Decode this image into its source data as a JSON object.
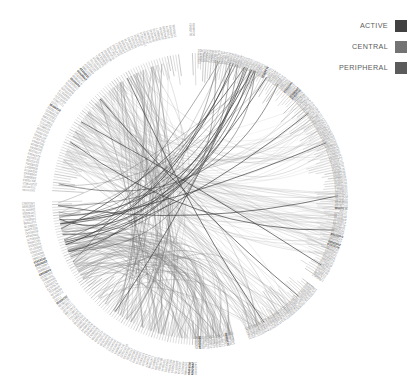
{
  "legend": {
    "items": [
      {
        "label": "ACTIVE",
        "color": "#414141"
      },
      {
        "label": "CENTRAL",
        "color": "#737373"
      },
      {
        "label": "PERIPHERAL",
        "color": "#5b5b5b"
      }
    ]
  },
  "chart_data": {
    "type": "chord",
    "title": "",
    "subtitle": "",
    "xlabel": "",
    "ylabel": "",
    "grid": false,
    "legend_position": "top-right",
    "center": {
      "x": 198,
      "y": 199
    },
    "radius": {
      "label_outer": 176,
      "label_inner": 150,
      "ring": 146,
      "chord": 140
    },
    "palette": {
      "background": "#ffffff",
      "label_default": "#8d8d8d",
      "label_highlight": "#3f3f3f",
      "chord_light": "#b4b4b4",
      "chord_mid": "#8a8a8a",
      "chord_dark": "#3a3a3a"
    },
    "groups": [
      {
        "name": "CENTRAL",
        "start_deg": 273,
        "end_deg": 353,
        "color": "#737373",
        "nodes": 76
      },
      {
        "name": "PERIPHERAL",
        "start_deg": 357,
        "end_deg": 123,
        "color": "#5b5b5b",
        "nodes": 122
      },
      {
        "name": "ACTIVE",
        "start_deg": 127,
        "end_deg": 160,
        "color": "#414141",
        "nodes": 32
      },
      {
        "name": "CENTRAL",
        "start_deg": 165,
        "end_deg": 269,
        "color": "#737373",
        "nodes": 98
      }
    ],
    "gaps_deg": [
      [
        353,
        357
      ],
      [
        123,
        127
      ],
      [
        160,
        165
      ],
      [
        269,
        273
      ]
    ],
    "node_count": 328,
    "node_labels": [
      "102570813",
      "30175963",
      "30096901",
      "30490243",
      "30240073",
      "30098077",
      "32480064",
      "54415039",
      "37105074",
      "41976083",
      "11781008",
      "30158061",
      "30148093",
      "30138064",
      "30148044",
      "40790090",
      "20128051",
      "10161018",
      "10298017",
      "10567011",
      "70481010",
      "20421088",
      "10064037",
      "10680020",
      "30178039",
      "31349936",
      "71022",
      "71709400",
      "49097100",
      "40985011",
      "41910173",
      "41005029",
      "50440017",
      "75079805",
      "33910210",
      "04000069",
      "47098850",
      "14601910",
      "29950929",
      "30191919",
      "10270986",
      "49091027",
      "11019203",
      "30920715",
      "41093016",
      "50210984",
      "60930175",
      "70915044",
      "80190332",
      "90210455",
      "10380276",
      "11470398",
      "12560417",
      "13650536",
      "14740655",
      "15830774",
      "16920893",
      "18010912",
      "19100031",
      "20190150"
    ],
    "highlight_labels": [
      "31349936",
      "04000069",
      "29950929",
      "30191919"
    ],
    "chord_bundles": [
      {
        "from_deg": 168,
        "to_deg": 236,
        "weight": 58,
        "shade": "#8f8f8f",
        "opacity": 0.55
      },
      {
        "from_deg": 180,
        "to_deg": 248,
        "weight": 52,
        "shade": "#858585",
        "opacity": 0.5
      },
      {
        "from_deg": 205,
        "to_deg": 330,
        "weight": 64,
        "shade": "#7d7d7d",
        "opacity": 0.5
      },
      {
        "from_deg": 150,
        "to_deg": 300,
        "weight": 46,
        "shade": "#9a9a9a",
        "opacity": 0.45
      },
      {
        "from_deg": 100,
        "to_deg": 300,
        "weight": 70,
        "shade": "#b0b0b0",
        "opacity": 0.4
      },
      {
        "from_deg": 60,
        "to_deg": 320,
        "weight": 40,
        "shade": "#a8a8a8",
        "opacity": 0.4
      },
      {
        "from_deg": 20,
        "to_deg": 260,
        "weight": 34,
        "shade": "#3c3c3c",
        "opacity": 0.8
      }
    ]
  }
}
